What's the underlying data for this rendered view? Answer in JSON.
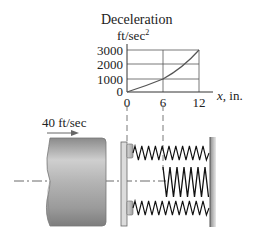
{
  "chart_data": {
    "type": "line",
    "title": "Deceleration",
    "ylabel": "Deceleration",
    "yunit": "ft/sec",
    "yunit_exp": "2",
    "xlabel": "x, in.",
    "x_ticks": [
      "0",
      "6",
      "12"
    ],
    "y_ticks": [
      "0",
      "1000",
      "2000",
      "3000"
    ],
    "xlim": [
      0,
      12
    ],
    "ylim": [
      0,
      3000
    ],
    "grid": true,
    "series": [
      {
        "name": "deceleration",
        "x": [
          0,
          6,
          12
        ],
        "y": [
          0,
          1000,
          3000
        ]
      }
    ]
  },
  "diagram": {
    "velocity_label": "40 ft/sec",
    "components": [
      "moving-cylinder",
      "buffer-plate",
      "outer-springs",
      "inner-spring",
      "fixed-wall",
      "centerline"
    ]
  }
}
